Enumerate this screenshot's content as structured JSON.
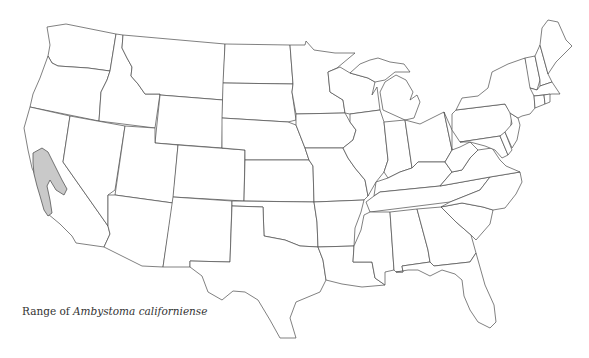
{
  "caption": {
    "prefix": "Range of",
    "species": "Ambystoma californiense"
  },
  "map": {
    "region": "Contiguous United States",
    "range_state": "California",
    "colors": {
      "state_fill": "#ffffff",
      "state_border": "#4a4a4a",
      "range_fill": "#c9c9c9",
      "background": "#ffffff"
    }
  }
}
